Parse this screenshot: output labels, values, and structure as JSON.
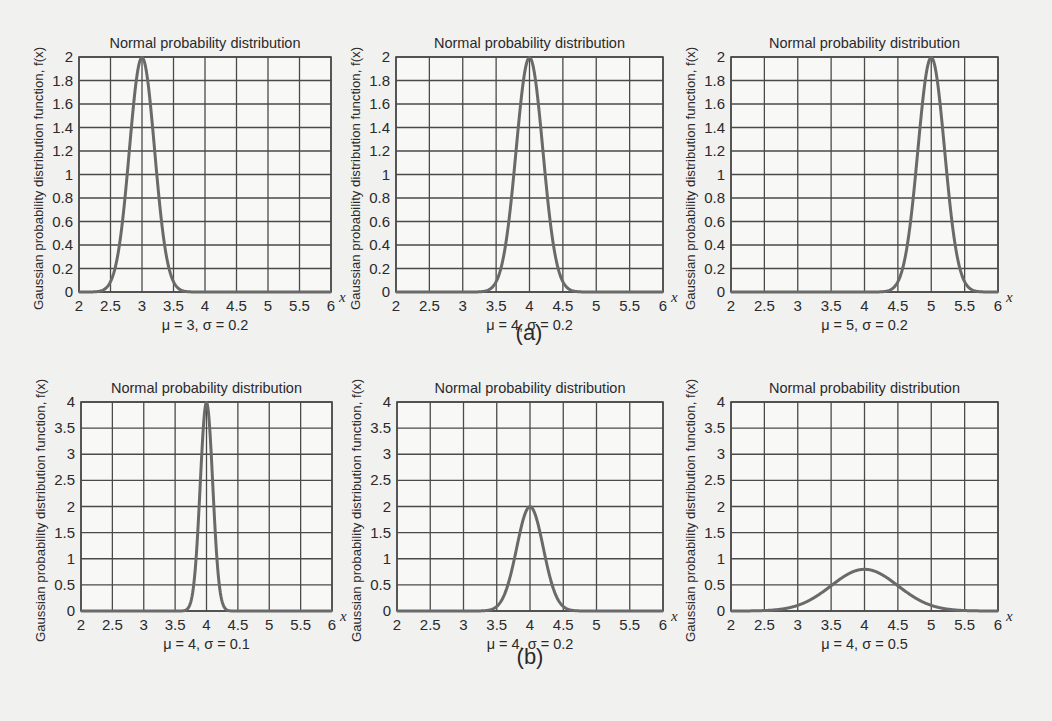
{
  "figure": {
    "row_labels": [
      "(a)",
      "(b)"
    ],
    "colors": {
      "background": "#f1f1f0",
      "plot_bg": "#f8f8f7",
      "grid": "#4a4a4a",
      "curve": "#6a6a6a",
      "text": "#2a2a2a"
    }
  },
  "chart_data": [
    {
      "type": "line",
      "panel": "(a)",
      "title": "Normal probability distribution",
      "xlabel": "x",
      "ylabel": "Gaussian probability distribution function, f(x)",
      "caption": "μ = 3, σ = 0.2",
      "mu": 3,
      "sigma": 0.2,
      "xlim": [
        2,
        6
      ],
      "ylim": [
        0,
        2
      ],
      "xticks": [
        "2",
        "2.5",
        "3",
        "3.5",
        "4",
        "4.5",
        "5",
        "5.5",
        "6"
      ],
      "yticks": [
        "0",
        "0.2",
        "0.4",
        "0.6",
        "0.8",
        "1",
        "1.2",
        "1.4",
        "1.6",
        "1.8",
        "2"
      ],
      "grid": true,
      "series": [
        {
          "name": "f(x)",
          "peak_x": 3,
          "peak_y": 1.995
        }
      ]
    },
    {
      "type": "line",
      "panel": "(a)",
      "title": "Normal probability distribution",
      "xlabel": "x",
      "ylabel": "Gaussian probability distribution function, f(x)",
      "caption": "μ = 4, σ = 0.2",
      "mu": 4,
      "sigma": 0.2,
      "xlim": [
        2,
        6
      ],
      "ylim": [
        0,
        2
      ],
      "xticks": [
        "2",
        "2.5",
        "3",
        "3.5",
        "4",
        "4.5",
        "5",
        "5.5",
        "6"
      ],
      "yticks": [
        "0",
        "0.2",
        "0.4",
        "0.6",
        "0.8",
        "1",
        "1.2",
        "1.4",
        "1.6",
        "1.8",
        "2"
      ],
      "grid": true,
      "series": [
        {
          "name": "f(x)",
          "peak_x": 4,
          "peak_y": 1.995
        }
      ]
    },
    {
      "type": "line",
      "panel": "(a)",
      "title": "Normal probability distribution",
      "xlabel": "x",
      "ylabel": "Gaussian probability distribution function, f(x)",
      "caption": "μ = 5, σ = 0.2",
      "mu": 5,
      "sigma": 0.2,
      "xlim": [
        2,
        6
      ],
      "ylim": [
        0,
        2
      ],
      "xticks": [
        "2",
        "2.5",
        "3",
        "3.5",
        "4",
        "4.5",
        "5",
        "5.5",
        "6"
      ],
      "yticks": [
        "0",
        "0.2",
        "0.4",
        "0.6",
        "0.8",
        "1",
        "1.2",
        "1.4",
        "1.6",
        "1.8",
        "2"
      ],
      "grid": true,
      "series": [
        {
          "name": "f(x)",
          "peak_x": 5,
          "peak_y": 1.995
        }
      ]
    },
    {
      "type": "line",
      "panel": "(b)",
      "title": "Normal probability distribution",
      "xlabel": "x",
      "ylabel": "Gaussian probability distribution function, f(x)",
      "caption": "μ = 4, σ = 0.1",
      "mu": 4,
      "sigma": 0.1,
      "xlim": [
        2,
        6
      ],
      "ylim": [
        0,
        4
      ],
      "xticks": [
        "2",
        "2.5",
        "3",
        "3.5",
        "4",
        "4.5",
        "5",
        "5.5",
        "6"
      ],
      "yticks": [
        "0",
        "0.5",
        "1",
        "1.5",
        "2",
        "2.5",
        "3",
        "3.5",
        "4"
      ],
      "grid": true,
      "series": [
        {
          "name": "f(x)",
          "peak_x": 4,
          "peak_y": 3.989
        }
      ]
    },
    {
      "type": "line",
      "panel": "(b)",
      "title": "Normal probability distribution",
      "xlabel": "x",
      "ylabel": "Gaussian probability distribution function, f(x)",
      "caption": "μ = 4, σ = 0.2",
      "mu": 4,
      "sigma": 0.2,
      "xlim": [
        2,
        6
      ],
      "ylim": [
        0,
        4
      ],
      "xticks": [
        "2",
        "2.5",
        "3",
        "3.5",
        "4",
        "4.5",
        "5",
        "5.5",
        "6"
      ],
      "yticks": [
        "0",
        "0.5",
        "1",
        "1.5",
        "2",
        "2.5",
        "3",
        "3.5",
        "4"
      ],
      "grid": true,
      "series": [
        {
          "name": "f(x)",
          "peak_x": 4,
          "peak_y": 1.995
        }
      ]
    },
    {
      "type": "line",
      "panel": "(b)",
      "title": "Normal probability distribution",
      "xlabel": "x",
      "ylabel": "Gaussian probability distribution function, f(x)",
      "caption": "μ = 4, σ = 0.5",
      "mu": 4,
      "sigma": 0.5,
      "xlim": [
        2,
        6
      ],
      "ylim": [
        0,
        4
      ],
      "xticks": [
        "2",
        "2.5",
        "3",
        "3.5",
        "4",
        "4.5",
        "5",
        "5.5",
        "6"
      ],
      "yticks": [
        "0",
        "0.5",
        "1",
        "1.5",
        "2",
        "2.5",
        "3",
        "3.5",
        "4"
      ],
      "grid": true,
      "series": [
        {
          "name": "f(x)",
          "peak_x": 4,
          "peak_y": 0.798
        }
      ]
    }
  ]
}
